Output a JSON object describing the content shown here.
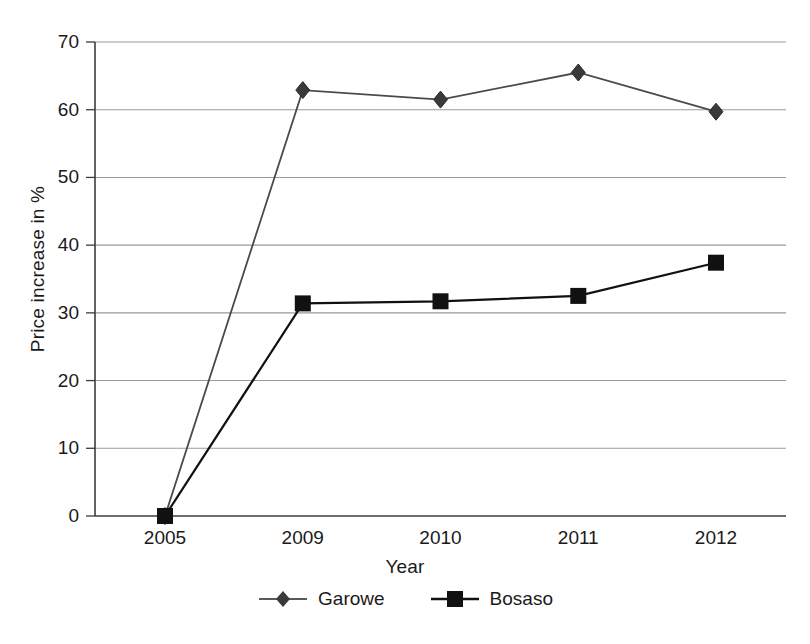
{
  "figure": {
    "title_remnant": "",
    "background": "#ffffff"
  },
  "axes": {
    "ylabel": "Price increase in %",
    "xlabel": "Year",
    "yticks": [
      "70",
      "60",
      "50",
      "40",
      "30",
      "20",
      "10",
      "0"
    ],
    "xticks": [
      "2005",
      "2009",
      "2010",
      "2011",
      "2012"
    ]
  },
  "legend": {
    "items": [
      {
        "label": "Garowe",
        "marker": "diamond-marker",
        "color": "#3a3a3a"
      },
      {
        "label": "Bosaso",
        "marker": "square-marker",
        "color": "#111111"
      }
    ]
  },
  "chart_data": {
    "type": "line",
    "title": "",
    "xlabel": "Year",
    "ylabel": "Price increase in %",
    "categories": [
      "2005",
      "2009",
      "2010",
      "2011",
      "2012"
    ],
    "ylim": [
      0,
      70
    ],
    "ytick_step": 10,
    "grid": true,
    "legend_position": "bottom-center",
    "series": [
      {
        "name": "Garowe",
        "color": "#3a3a3a",
        "marker": "diamond",
        "values": [
          0,
          62.9,
          61.5,
          65.5,
          59.7
        ]
      },
      {
        "name": "Bosaso",
        "color": "#111111",
        "marker": "square",
        "values": [
          0,
          31.4,
          31.7,
          32.5,
          37.4
        ]
      }
    ]
  }
}
